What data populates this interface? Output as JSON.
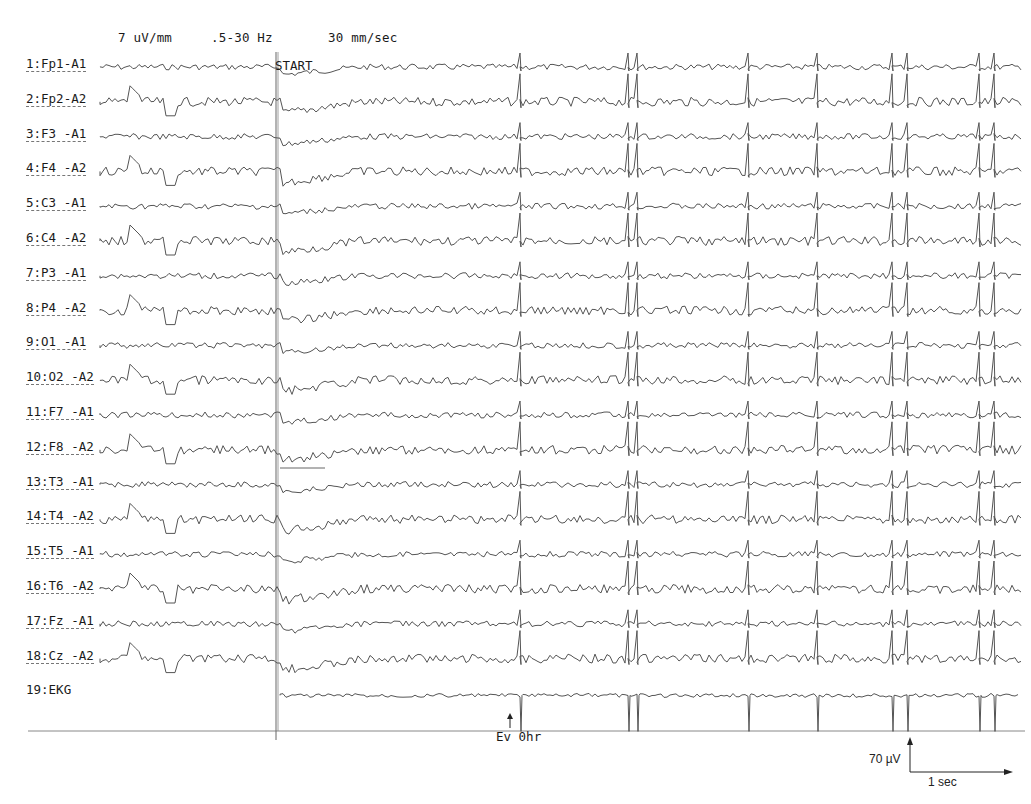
{
  "header": {
    "sensitivity": "7 uV/mm",
    "filter": ".5-30 Hz",
    "paper_speed": "30  mm/sec"
  },
  "markers": {
    "start_label": "START",
    "event_label": "Ev 0hr"
  },
  "calibration": {
    "amplitude_label": "70 µV",
    "time_label": "1 sec"
  },
  "chart_data": {
    "type": "line",
    "settings": {
      "sensitivity_uV_per_mm": 7,
      "filter_Hz": [
        0.5,
        30
      ],
      "paper_speed_mm_per_sec": 30
    },
    "channels": [
      {
        "id": 1,
        "label": "1:Fp1-A1"
      },
      {
        "id": 2,
        "label": "2:Fp2-A2"
      },
      {
        "id": 3,
        "label": "3:F3 -A1"
      },
      {
        "id": 4,
        "label": "4:F4 -A2"
      },
      {
        "id": 5,
        "label": "5:C3 -A1"
      },
      {
        "id": 6,
        "label": "6:C4 -A2"
      },
      {
        "id": 7,
        "label": "7:P3 -A1"
      },
      {
        "id": 8,
        "label": "8:P4 -A2"
      },
      {
        "id": 9,
        "label": "9:O1 -A1"
      },
      {
        "id": 10,
        "label": "10:O2 -A2"
      },
      {
        "id": 11,
        "label": "11:F7 -A1"
      },
      {
        "id": 12,
        "label": "12:F8 -A2"
      },
      {
        "id": 13,
        "label": "13:T3 -A1"
      },
      {
        "id": 14,
        "label": "14:T4 -A2"
      },
      {
        "id": 15,
        "label": "15:T5 -A1"
      },
      {
        "id": 16,
        "label": "16:T6 -A2"
      },
      {
        "id": 17,
        "label": "17:Fz -A1"
      },
      {
        "id": 18,
        "label": "18:Cz -A2"
      },
      {
        "id": 19,
        "label": "19:EKG"
      }
    ],
    "annotations": [
      {
        "text": "START",
        "position": "stimulus onset vertical line"
      },
      {
        "text": "Ev 0hr",
        "position": "event marker arrow under baseline"
      }
    ],
    "calibration_bar": {
      "amplitude": "70 µV",
      "time": "1 sec"
    },
    "spike_artifacts_x_px": [
      521,
      627,
      637,
      748,
      818,
      892,
      908,
      980,
      993
    ],
    "legend": [],
    "grid": false
  }
}
